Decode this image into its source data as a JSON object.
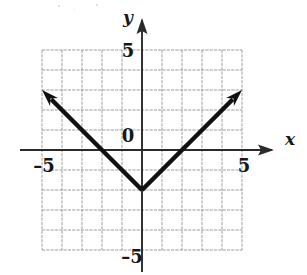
{
  "figure": {
    "kind": "coordinate-plane-graph",
    "background_color": "#ffffff",
    "ink_color": "#171717",
    "grid_color": "#8d8d8d",
    "axis_color": "#2b2b2b",
    "curve_color": "#111111"
  },
  "axes": {
    "x_label": "x",
    "y_label": "y",
    "origin_label": "0",
    "x_ticks": [
      {
        "value": -5,
        "label": "–5"
      },
      {
        "value": 5,
        "label": "5"
      }
    ],
    "y_ticks": [
      {
        "value": 5,
        "label": "5"
      },
      {
        "value": -5,
        "label": "–5"
      }
    ],
    "x_arrow": true,
    "y_arrow": true
  },
  "chart_data": {
    "type": "line",
    "title": "",
    "xlabel": "x",
    "ylabel": "y",
    "xlim": [
      -5,
      5
    ],
    "ylim": [
      -5,
      5
    ],
    "xticks": [
      -5,
      5
    ],
    "yticks": [
      -5,
      5
    ],
    "grid": true,
    "grid_step": 1,
    "legend": "none",
    "series": [
      {
        "name": "y = |x| - 2",
        "equation": "y = |x| − 2",
        "shape": "absolute-value-v",
        "vertex": [
          0,
          -2
        ],
        "left_slope": -1,
        "right_slope": 1,
        "arrowheads": [
          "left-end",
          "right-end"
        ],
        "x": [
          -5,
          -4,
          -3,
          -2,
          -1,
          0,
          1,
          2,
          3,
          4,
          5
        ],
        "values": [
          3,
          2,
          1,
          0,
          -1,
          -2,
          -1,
          0,
          1,
          2,
          3
        ],
        "x_intercepts": [
          -2,
          2
        ],
        "y_intercept": -2
      }
    ]
  }
}
